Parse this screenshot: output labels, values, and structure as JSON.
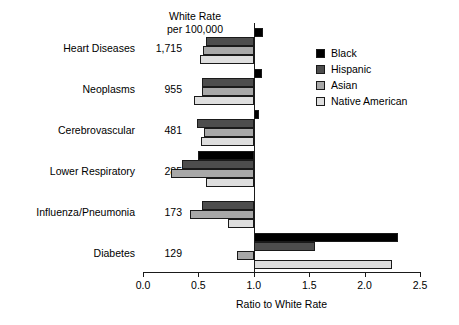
{
  "header": {
    "rate_column_title": "White Rate\nper 100,000"
  },
  "legend": {
    "position": "top-right",
    "entries": [
      {
        "label": "Black",
        "color": "#000000"
      },
      {
        "label": "Hispanic",
        "color": "#4d4d4d"
      },
      {
        "label": "Asian",
        "color": "#a8a8a8"
      },
      {
        "label": "Native American",
        "color": "#dedede"
      }
    ]
  },
  "axis": {
    "ticks": [
      "0.0",
      "0.5",
      "1.0",
      "1.5",
      "2.0",
      "2.5"
    ],
    "tick_values": [
      0.0,
      0.5,
      1.0,
      1.5,
      2.0,
      2.5
    ],
    "title": "Ratio to White Rate"
  },
  "rows": [
    {
      "label": "Heart Diseases",
      "rate": "1,715"
    },
    {
      "label": "Neoplasms",
      "rate": "955"
    },
    {
      "label": "Cerebrovascular",
      "rate": "481"
    },
    {
      "label": "Lower Respiratory",
      "rate": "285"
    },
    {
      "label": "Influenza/Pneumonia",
      "rate": "173"
    },
    {
      "label": "Diabetes",
      "rate": "129"
    }
  ],
  "chart_data": {
    "type": "bar",
    "orientation": "horizontal",
    "title": "",
    "xlabel": "Ratio to White Rate",
    "ylabel": "",
    "xlim": [
      0.0,
      2.5
    ],
    "baseline": 1.0,
    "grid": false,
    "legend_position": "top-right",
    "categories": [
      "Heart Diseases",
      "Neoplasms",
      "Cerebrovascular",
      "Lower Respiratory",
      "Influenza/Pneumonia",
      "Diabetes"
    ],
    "white_rate_per_100000": [
      1715,
      955,
      481,
      285,
      173,
      129
    ],
    "series": [
      {
        "name": "Black",
        "color": "#000000",
        "values": [
          1.08,
          1.07,
          1.05,
          0.5,
          1.0,
          2.3
        ]
      },
      {
        "name": "Hispanic",
        "color": "#4d4d4d",
        "values": [
          0.57,
          0.53,
          0.49,
          0.35,
          0.53,
          1.55
        ]
      },
      {
        "name": "Asian",
        "color": "#a8a8a8",
        "values": [
          0.54,
          0.53,
          0.55,
          0.25,
          0.42,
          0.85
        ]
      },
      {
        "name": "Native American",
        "color": "#dedede",
        "values": [
          0.51,
          0.46,
          0.52,
          0.57,
          0.77,
          2.25
        ]
      }
    ]
  }
}
